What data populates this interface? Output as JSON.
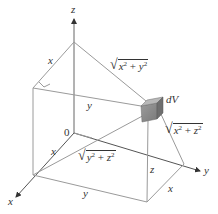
{
  "diagram": {
    "type": "3d-coordinate-volume-element",
    "axes": {
      "z_label": "z",
      "x_label": "x",
      "y_label": "y",
      "origin_label": "0"
    },
    "element_label": "dV",
    "edge_labels": {
      "top_left_x": "x",
      "upper_y": "y",
      "lower_x": "x",
      "bottom_y": "y",
      "vertical_z": "z",
      "right_x": "x"
    },
    "distance_labels": {
      "sqrt_x2_y2": {
        "a": "x",
        "b": "y",
        "exp": "2",
        "plus": " + "
      },
      "sqrt_y2_z2": {
        "a": "y",
        "b": "z",
        "exp": "2",
        "plus": " + "
      },
      "sqrt_x2_z2": {
        "a": "x",
        "b": "z",
        "exp": "2",
        "plus": " + "
      }
    },
    "colors": {
      "line": "#9a9a9a",
      "axis": "#555555",
      "text": "#333333",
      "box_front": "#8c8c8c",
      "box_top": "#b5b5b5",
      "box_side": "#6e6e6e"
    }
  }
}
